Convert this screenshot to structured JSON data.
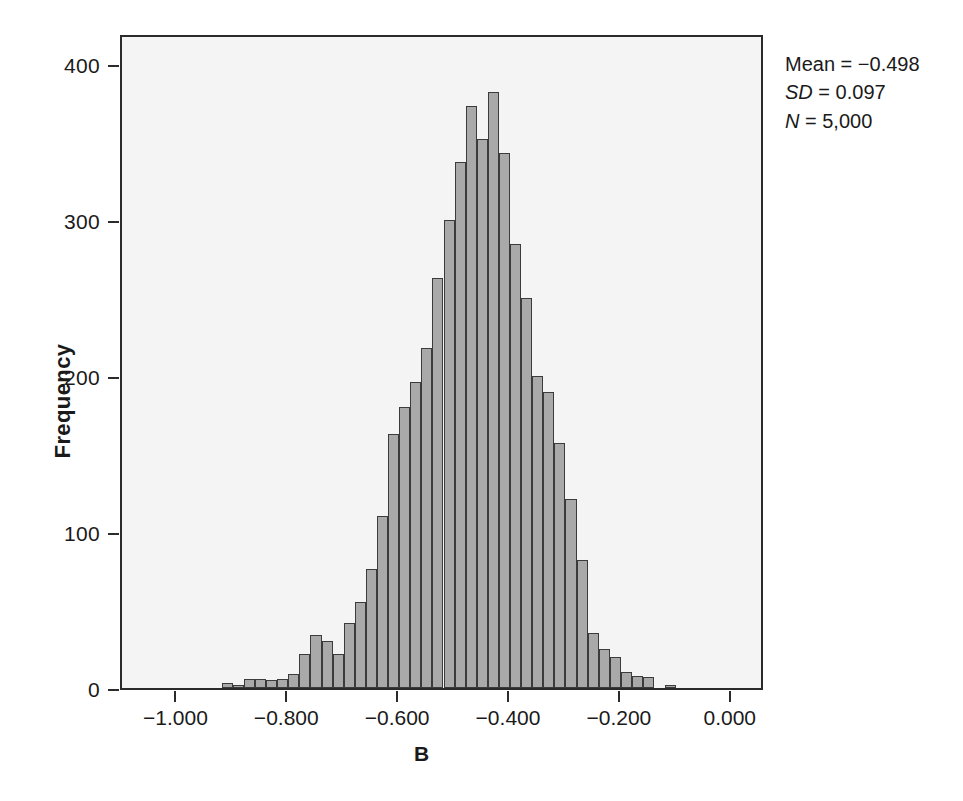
{
  "chart_data": {
    "type": "bar",
    "title": "",
    "subtitle": "",
    "xlabel": "B",
    "ylabel": "Frequency",
    "xlim": [
      -1.1,
      0.06
    ],
    "ylim": [
      0,
      420
    ],
    "grid": false,
    "legend": null,
    "bin_width": 0.02,
    "x_ticks": [
      -1.0,
      -0.8,
      -0.6,
      -0.4,
      -0.2,
      0.0
    ],
    "x_tick_labels": [
      "−1.000",
      "−0.800",
      "−0.600",
      "−0.400",
      "−0.200",
      "0.000"
    ],
    "y_ticks": [
      0,
      100,
      200,
      300,
      400
    ],
    "y_tick_labels": [
      "0",
      "100",
      "200",
      "300",
      "400"
    ],
    "bar_fill_color": "#a9a9a9",
    "bar_edge_color": "#3b3b3b",
    "plot_background": "#f4f4f4",
    "x": [
      -0.91,
      -0.89,
      -0.87,
      -0.85,
      -0.83,
      -0.81,
      -0.79,
      -0.77,
      -0.75,
      -0.73,
      -0.71,
      -0.69,
      -0.67,
      -0.65,
      -0.63,
      -0.61,
      -0.59,
      -0.57,
      -0.55,
      -0.53,
      -0.51,
      -0.49,
      -0.47,
      -0.45,
      -0.43,
      -0.41,
      -0.39,
      -0.37,
      -0.35,
      -0.33,
      -0.31,
      -0.29,
      -0.27,
      -0.25,
      -0.23,
      -0.21,
      -0.19,
      -0.17,
      -0.15,
      -0.11
    ],
    "values": [
      3,
      2,
      6,
      6,
      5,
      6,
      9,
      22,
      34,
      30,
      22,
      42,
      55,
      76,
      110,
      163,
      180,
      196,
      218,
      263,
      300,
      337,
      373,
      352,
      382,
      343,
      285,
      250,
      200,
      190,
      157,
      121,
      82,
      35,
      25,
      20,
      10,
      8,
      7,
      2
    ],
    "annotations": [
      {
        "name": "mean",
        "label": "Mean",
        "value": "−0.498",
        "text": "Mean = −0.498"
      },
      {
        "name": "sd",
        "label": "SD",
        "value": "0.097",
        "text": "SD = 0.097"
      },
      {
        "name": "n",
        "label": "N",
        "value": "5,000",
        "text": "N = 5,000"
      }
    ]
  },
  "stats": {
    "mean_label": "Mean",
    "mean_eq": " = −0.498",
    "sd_label": "SD",
    "sd_eq": " = 0.097",
    "n_label": "N",
    "n_eq": " = 5,000"
  }
}
